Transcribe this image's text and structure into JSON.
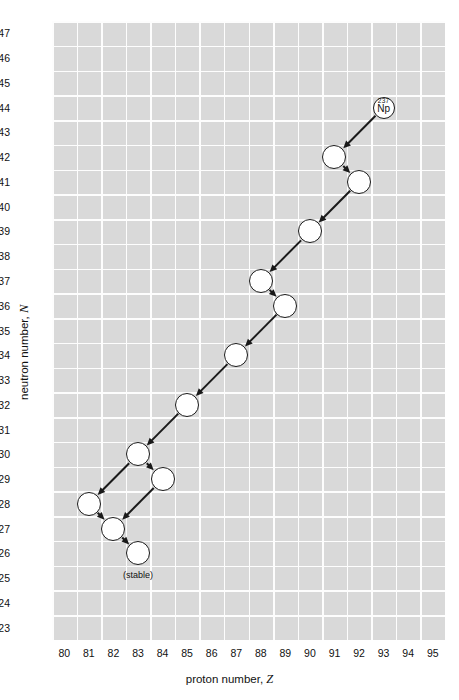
{
  "figure": {
    "background_color": "#d9d9d9",
    "gridline_color": "#ffffff",
    "node_fill": "#ffffff",
    "node_stroke": "#1a1a1a",
    "arrow_color": "#1a1a1a"
  },
  "axes": {
    "x": {
      "title_text": "proton number, ",
      "title_symbol": "Z",
      "min": 80,
      "max": 95,
      "ticks": [
        80,
        81,
        82,
        83,
        84,
        85,
        86,
        87,
        88,
        89,
        90,
        91,
        92,
        93,
        94,
        95
      ]
    },
    "y": {
      "title_text": "neutron number, ",
      "title_symbol": "N",
      "min": 123,
      "max": 147,
      "ticks": [
        147,
        146,
        145,
        144,
        143,
        142,
        141,
        140,
        139,
        138,
        137,
        136,
        135,
        134,
        133,
        132,
        131,
        130,
        129,
        128,
        127,
        126,
        125,
        124,
        123
      ]
    }
  },
  "annotations": {
    "stable_label": "(stable)",
    "parent_mass_number": "237",
    "parent_symbol": "Np"
  },
  "chart_data": {
    "type": "scatter",
    "title": "",
    "xlabel": "proton number, Z",
    "ylabel": "neutron number, N",
    "xlim": [
      80,
      95
    ],
    "ylim": [
      123,
      147
    ],
    "grid": true,
    "legend": "none",
    "nodes": [
      {
        "id": "n0",
        "Z": 93,
        "N": 144,
        "label_sup": "237",
        "label_el": "Np",
        "labeled": true,
        "stable": false,
        "radius": 11
      },
      {
        "id": "n1",
        "Z": 91,
        "N": 142,
        "label_sup": "",
        "label_el": "",
        "labeled": false,
        "stable": false,
        "radius": 12
      },
      {
        "id": "n2",
        "Z": 92,
        "N": 141,
        "label_sup": "",
        "label_el": "",
        "labeled": false,
        "stable": false,
        "radius": 12
      },
      {
        "id": "n3",
        "Z": 90,
        "N": 139,
        "label_sup": "",
        "label_el": "",
        "labeled": false,
        "stable": false,
        "radius": 12
      },
      {
        "id": "n4",
        "Z": 88,
        "N": 137,
        "label_sup": "",
        "label_el": "",
        "labeled": false,
        "stable": false,
        "radius": 12
      },
      {
        "id": "n5",
        "Z": 89,
        "N": 136,
        "label_sup": "",
        "label_el": "",
        "labeled": false,
        "stable": false,
        "radius": 12
      },
      {
        "id": "n6",
        "Z": 87,
        "N": 134,
        "label_sup": "",
        "label_el": "",
        "labeled": false,
        "stable": false,
        "radius": 12
      },
      {
        "id": "n7",
        "Z": 85,
        "N": 132,
        "label_sup": "",
        "label_el": "",
        "labeled": false,
        "stable": false,
        "radius": 12
      },
      {
        "id": "n8",
        "Z": 83,
        "N": 130,
        "label_sup": "",
        "label_el": "",
        "labeled": false,
        "stable": false,
        "radius": 12
      },
      {
        "id": "n9",
        "Z": 84,
        "N": 129,
        "label_sup": "",
        "label_el": "",
        "labeled": false,
        "stable": false,
        "radius": 12
      },
      {
        "id": "n10",
        "Z": 81,
        "N": 128,
        "label_sup": "",
        "label_el": "",
        "labeled": false,
        "stable": false,
        "radius": 12
      },
      {
        "id": "n11",
        "Z": 82,
        "N": 127,
        "label_sup": "",
        "label_el": "",
        "labeled": false,
        "stable": false,
        "radius": 12
      },
      {
        "id": "n12",
        "Z": 83,
        "N": 126,
        "label_sup": "",
        "label_el": "",
        "labeled": false,
        "stable": true,
        "radius": 12
      }
    ],
    "edges": [
      {
        "from": "n0",
        "to": "n1",
        "decay": "alpha"
      },
      {
        "from": "n1",
        "to": "n2",
        "decay": "beta"
      },
      {
        "from": "n2",
        "to": "n3",
        "decay": "alpha"
      },
      {
        "from": "n3",
        "to": "n4",
        "decay": "alpha"
      },
      {
        "from": "n4",
        "to": "n5",
        "decay": "beta"
      },
      {
        "from": "n5",
        "to": "n6",
        "decay": "alpha"
      },
      {
        "from": "n6",
        "to": "n7",
        "decay": "alpha"
      },
      {
        "from": "n7",
        "to": "n8",
        "decay": "alpha"
      },
      {
        "from": "n8",
        "to": "n9",
        "decay": "beta"
      },
      {
        "from": "n8",
        "to": "n10",
        "decay": "alpha"
      },
      {
        "from": "n9",
        "to": "n11",
        "decay": "alpha"
      },
      {
        "from": "n10",
        "to": "n11",
        "decay": "beta"
      },
      {
        "from": "n11",
        "to": "n12",
        "decay": "beta"
      }
    ]
  }
}
